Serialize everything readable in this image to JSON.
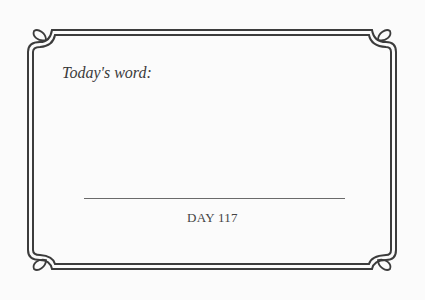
{
  "card": {
    "prompt_label": "Today's word:",
    "answer_value": "",
    "day_label": "DAY 117"
  },
  "colors": {
    "background": "#fbfbfb",
    "frame": "#3c3c3c",
    "text": "#3a3a3a"
  }
}
